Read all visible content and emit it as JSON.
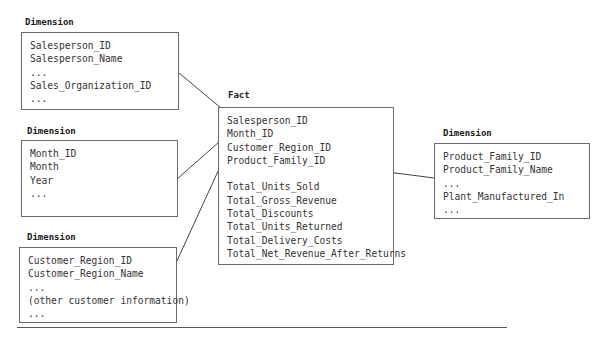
{
  "diagram_title": "Star schema",
  "dimensions": [
    {
      "id": "salesperson",
      "label": "Dimension",
      "fields": [
        "Salesperson_ID",
        "Salesperson_Name",
        "...",
        "Sales_Organization_ID",
        "..."
      ]
    },
    {
      "id": "month",
      "label": "Dimension",
      "fields": [
        "Month_ID",
        "Month",
        "Year",
        "..."
      ]
    },
    {
      "id": "customer-region",
      "label": "Dimension",
      "fields": [
        "Customer_Region_ID",
        "Customer_Region_Name",
        "...",
        "(other customer information)",
        "..."
      ]
    },
    {
      "id": "product-family",
      "label": "Dimension",
      "fields": [
        "Product_Family_ID",
        "Product_Family_Name",
        "...",
        "Plant_Manufactured_In",
        "..."
      ]
    }
  ],
  "fact": {
    "label": "Fact",
    "keys": [
      "Salesperson_ID",
      "Month_ID",
      "Customer_Region_ID",
      "Product_Family_ID"
    ],
    "measures": [
      "Total_Units_Sold",
      "Total_Gross_Revenue",
      "Total_Discounts",
      "Total_Units_Returned",
      "Total_Delivery_Costs",
      "Total_Net_Revenue_After_Returns"
    ]
  },
  "links": [
    {
      "from": "salesperson",
      "to_key": "Salesperson_ID"
    },
    {
      "from": "month",
      "to_key": "Month_ID"
    },
    {
      "from": "customer-region",
      "to_key": "Customer_Region_ID"
    },
    {
      "from": "product-family",
      "to_key": "Product_Family_ID"
    }
  ]
}
